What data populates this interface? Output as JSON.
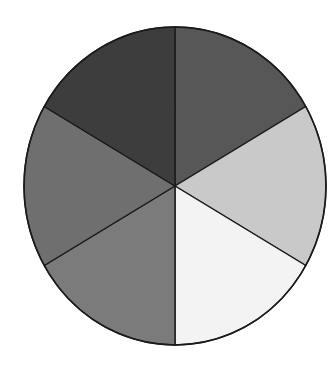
{
  "chart_data": {
    "type": "pie",
    "title": "",
    "categories": [
      "Slice 1",
      "Slice 2",
      "Slice 3",
      "Slice 4",
      "Slice 5",
      "Slice 6"
    ],
    "values": [
      16.67,
      16.67,
      16.67,
      16.67,
      16.67,
      16.67
    ],
    "colors": [
      "#575757",
      "#c9c9c9",
      "#f3f3f3",
      "#7b7b7b",
      "#6f6f6f",
      "#3d3d3d"
    ],
    "legend": false,
    "labels_shown": false,
    "start_angle_deg": 90,
    "direction": "clockwise",
    "stroke_color": "#1a1a1a",
    "geometry": {
      "cx": 175,
      "cy": 186,
      "rx": 151,
      "ry": 159
    }
  }
}
